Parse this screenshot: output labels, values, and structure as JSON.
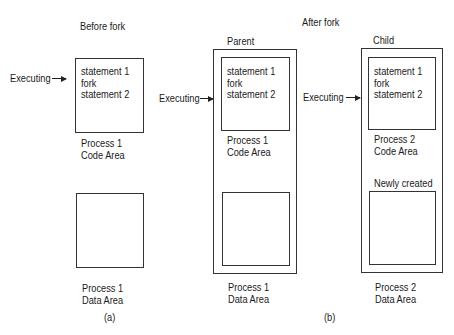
{
  "panel_a": {
    "heading": "Before fork",
    "executing_label": "Executing",
    "code_lines": [
      "statement 1",
      "fork",
      "statement 2"
    ],
    "code_area_label": [
      "Process 1",
      "Code Area"
    ],
    "data_area_label": [
      "Process 1",
      "Data Area"
    ],
    "caption": "(a)"
  },
  "panel_b": {
    "heading": "After fork",
    "caption": "(b)",
    "parent": {
      "title": "Parent",
      "executing_label": "Executing",
      "code_lines": [
        "statement 1",
        "fork",
        "statement 2"
      ],
      "code_area_label": [
        "Process 1",
        "Code Area"
      ],
      "data_area_label": [
        "Process 1",
        "Data Area"
      ]
    },
    "child": {
      "title": "Child",
      "executing_label": "Executing",
      "code_lines": [
        "statement 1",
        "fork",
        "statement 2"
      ],
      "code_area_label": [
        "Process 2",
        "Code Area"
      ],
      "data_note": "Newly created",
      "data_area_label": [
        "Process 2",
        "Data Area"
      ]
    }
  }
}
